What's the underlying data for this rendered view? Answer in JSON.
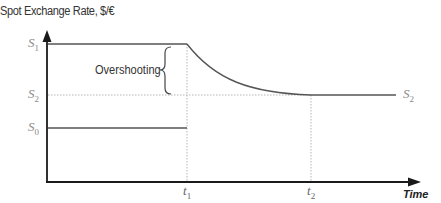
{
  "y_axis": {
    "label": "Spot Exchange Rate, $/€"
  },
  "x_axis": {
    "label": "Time"
  },
  "levels": [
    {
      "name": "S",
      "sub": "1",
      "y": 44
    },
    {
      "name": "S",
      "sub": "2",
      "y": 95
    },
    {
      "name": "S",
      "sub": "0",
      "y": 128
    }
  ],
  "right_label": {
    "name": "S",
    "sub": "2"
  },
  "ticks": [
    {
      "name": "t",
      "sub": "1",
      "x": 187
    },
    {
      "name": "t",
      "sub": "2",
      "x": 311
    }
  ],
  "annotation": "Overshooting",
  "colors": {
    "axis": "#1a1a1a",
    "line": "#555555",
    "guide": "#b0b0b0",
    "label": "#8a8a8a"
  }
}
